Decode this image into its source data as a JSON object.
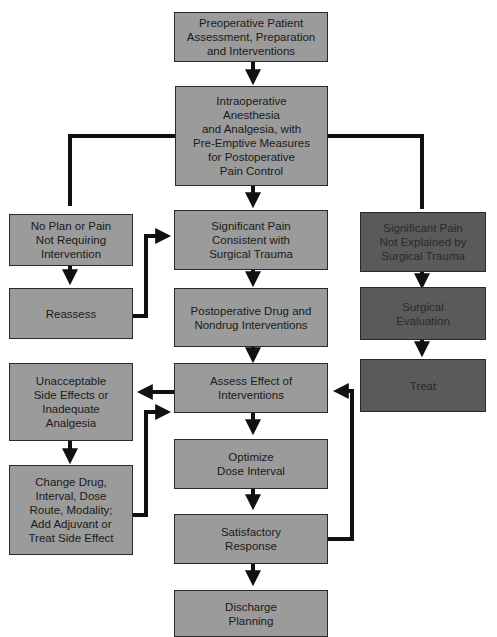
{
  "diagram": {
    "nodes": {
      "preop": "Preoperative Patient\nAssessment, Preparation\nand Interventions",
      "intraop": "Intraoperative\nAnesthesia\nand Analgesia, with\nPre-Emptive Measures\nfor Postoperative\nPain Control",
      "no_plan": "No Plan or Pain\nNot Requiring\nIntervention",
      "sig_consistent": "Significant Pain\nConsistent with\nSurgical Trauma",
      "sig_not_explained": "Significant Pain\nNot Explained by\nSurgical Trauma",
      "reassess": "Reassess",
      "postop_drug": "Postoperative Drug and\nNondrug Interventions",
      "surgical_eval": "Surgical\nEvaluation",
      "unacceptable": "Unacceptable\nSide Effects or\nInadequate\nAnalgesia",
      "assess_effect": "Assess Effect of\nInterventions",
      "treat": "Treat",
      "optimize": "Optimize\nDose Interval",
      "change_drug": "Change Drug,\nInterval, Dose\nRoute, Modality;\nAdd Adjuvant or\nTreat Side Effect",
      "satisfactory": "Satisfactory\nResponse",
      "discharge": "Discharge\nPlanning"
    },
    "colors": {
      "light_box": "#9b9b9b",
      "dark_box": "#5a5a5a",
      "line": "#111111"
    }
  }
}
